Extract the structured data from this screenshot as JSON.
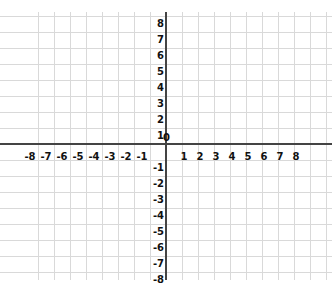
{
  "chart_data": {
    "type": "coordinate-plane",
    "title": "",
    "xlabel": "",
    "ylabel": "",
    "xlim": [
      -8,
      8
    ],
    "ylim": [
      -8,
      8
    ],
    "grid": true,
    "x_ticks": [
      "-8",
      "-7",
      "-6",
      "-5",
      "-4",
      "-3",
      "-2",
      "-1",
      "1",
      "2",
      "3",
      "4",
      "5",
      "6",
      "7",
      "8"
    ],
    "y_ticks": [
      "8",
      "7",
      "6",
      "5",
      "4",
      "3",
      "2",
      "1",
      "-1",
      "-2",
      "-3",
      "-4",
      "-5",
      "-6",
      "-7",
      "-8"
    ],
    "origin_label": "0",
    "series": []
  },
  "colors": {
    "grid": "#d9d9d9",
    "axis": "#444444",
    "label": "#111111"
  }
}
